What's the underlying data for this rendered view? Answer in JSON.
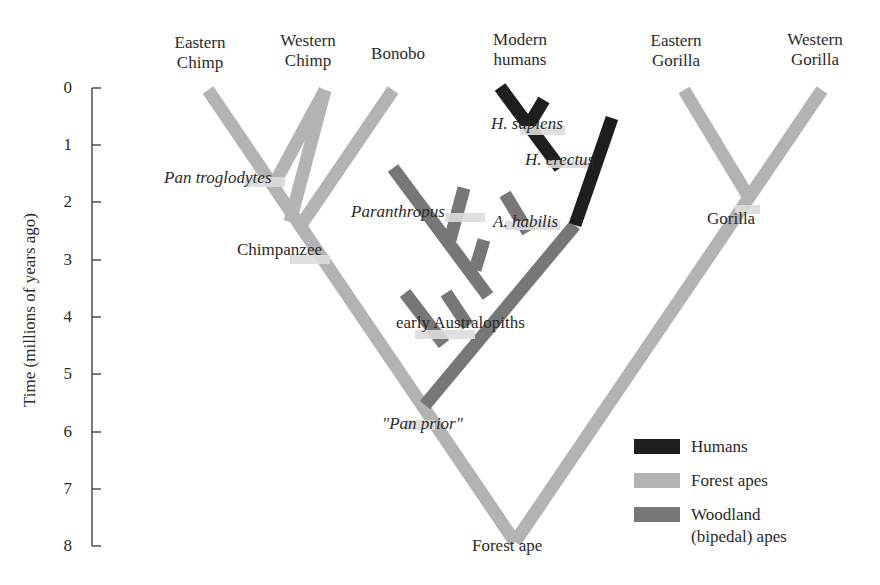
{
  "colors": {
    "humans": "#1e1e1e",
    "forest_apes": "#b3b3b3",
    "woodland_apes": "#777777",
    "text": "#2a2a2a",
    "axis": "#333333"
  },
  "axis": {
    "label": "Time (millions of years ago)",
    "ticks": [
      "0",
      "1",
      "2",
      "3",
      "4",
      "5",
      "6",
      "7",
      "8"
    ]
  },
  "taxa": {
    "eastern_chimp": {
      "line1": "Eastern",
      "line2": "Chimp"
    },
    "western_chimp": {
      "line1": "Western",
      "line2": "Chimp"
    },
    "bonobo": {
      "line1": "Bonobo"
    },
    "modern_humans": {
      "line1": "Modern",
      "line2": "humans"
    },
    "eastern_gorilla": {
      "line1": "Eastern",
      "line2": "Gorilla"
    },
    "western_gorilla": {
      "line1": "Western",
      "line2": "Gorilla"
    }
  },
  "nodes": {
    "pan_troglodytes": "Pan troglodytes",
    "chimpanzee": "Chimpanzee",
    "paranthropus": "Paranthropus",
    "h_sapiens": "H. sapiens",
    "h_erectus": "H. erectus",
    "a_habilis": "A. habilis",
    "gorilla": "Gorilla",
    "early_australopiths": "early Australopiths",
    "pan_prior": "\"Pan prior\"",
    "forest_ape": "Forest ape"
  },
  "legend": {
    "items": [
      {
        "label": "Humans",
        "key": "humans"
      },
      {
        "label": "Forest apes",
        "key": "forest_apes"
      },
      {
        "label": "Woodland",
        "label2": "(bipedal) apes",
        "key": "woodland_apes"
      }
    ]
  }
}
